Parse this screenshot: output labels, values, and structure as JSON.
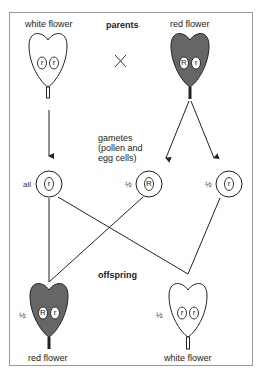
{
  "colors": {
    "border": "#999999",
    "line": "#222222",
    "red_flower_fill": "#666666",
    "white_flower_fill": "#ffffff",
    "allele_oval_fill": "#ffffff"
  },
  "parents": {
    "heading": "parents",
    "cross_symbol": "×",
    "left": {
      "label": "white flower",
      "alleles": [
        "r",
        "r"
      ],
      "color": "white"
    },
    "right": {
      "label": "red flower",
      "alleles": [
        "R",
        "r"
      ],
      "color": "red"
    }
  },
  "gametes": {
    "label_lines": [
      "gametes",
      "(pollen and",
      "egg cells)"
    ],
    "items": [
      {
        "fraction": "all",
        "allele": "r",
        "from": "white flower"
      },
      {
        "fraction": "½",
        "allele": "R",
        "from": "red flower"
      },
      {
        "fraction": "½",
        "allele": "r",
        "from": "red flower"
      }
    ]
  },
  "offspring": {
    "heading": "offspring",
    "items": [
      {
        "fraction": "½",
        "label": "red flower",
        "alleles": [
          "R",
          "r"
        ],
        "color": "red"
      },
      {
        "fraction": "½",
        "label": "white flower",
        "alleles": [
          "r",
          "r"
        ],
        "color": "white"
      }
    ]
  }
}
